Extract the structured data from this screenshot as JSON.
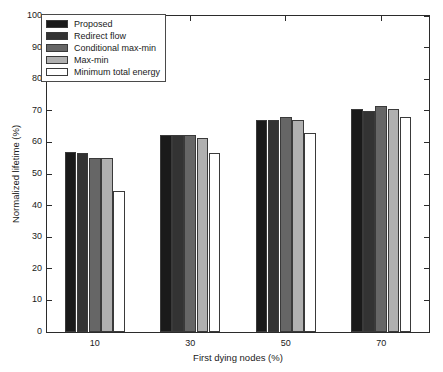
{
  "chart_data": {
    "type": "bar",
    "title": "",
    "xlabel": "First dying nodes (%)",
    "ylabel": "Normalized lifetime (%)",
    "categories": [
      "10",
      "30",
      "50",
      "70"
    ],
    "ylim": [
      0,
      100
    ],
    "yticks": [
      0,
      10,
      20,
      30,
      40,
      50,
      60,
      70,
      80,
      90,
      100
    ],
    "grid": false,
    "legend_position": "upper left",
    "series": [
      {
        "name": "Proposed",
        "color": "#1a1a1a",
        "values": [
          57,
          62.5,
          67,
          70.5
        ]
      },
      {
        "name": "Redirect flow",
        "color": "#333333",
        "values": [
          56.5,
          62.5,
          67,
          70
        ]
      },
      {
        "name": "Conditional max-min",
        "color": "#666666",
        "values": [
          55,
          62.5,
          68,
          71.5
        ]
      },
      {
        "name": "Max-min",
        "color": "#b0b0b0",
        "values": [
          55,
          61.5,
          67,
          70.5
        ]
      },
      {
        "name": "Minimum total energy",
        "color": "#ffffff",
        "values": [
          44.5,
          56.5,
          63,
          68
        ]
      }
    ]
  }
}
